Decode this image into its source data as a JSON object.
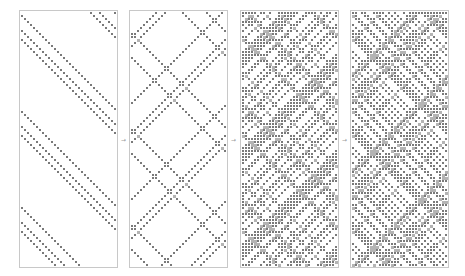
{
  "figure": {
    "panels": [
      {
        "id": "panel-1",
        "density": 0.06,
        "seed": 11
      },
      {
        "id": "panel-2",
        "density": 0.22,
        "seed": 23
      },
      {
        "id": "panel-3",
        "density": 0.42,
        "seed": 37
      },
      {
        "id": "panel-4",
        "density": 0.62,
        "seed": 53
      }
    ],
    "separator_glyph": "→"
  },
  "colors": {
    "cell": "#7a7a7a",
    "collision": "#b4b4b4",
    "frame": "#c8c8c8",
    "background": "#ffffff"
  }
}
